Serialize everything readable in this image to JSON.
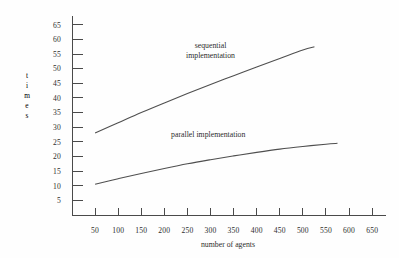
{
  "chart_data": {
    "type": "line",
    "title": "",
    "xlabel": "number of agents",
    "ylabel": "times",
    "ylabel_letters": [
      "t",
      "i",
      "m",
      "e",
      "s"
    ],
    "xlim": [
      0,
      680
    ],
    "ylim": [
      0,
      68
    ],
    "xticks": [
      50,
      100,
      150,
      200,
      250,
      300,
      350,
      400,
      450,
      500,
      550,
      600,
      650
    ],
    "xtick_labels": [
      "50",
      "100",
      "150",
      "200",
      "250",
      "300",
      "350",
      "400",
      "450",
      "500",
      "550",
      "600",
      "650"
    ],
    "yticks": [
      5,
      10,
      15,
      20,
      25,
      30,
      35,
      40,
      45,
      50,
      55,
      60,
      65
    ],
    "ytick_labels": [
      "5",
      "10",
      "15",
      "20",
      "25",
      "30",
      "35",
      "40",
      "45",
      "50",
      "55",
      "60",
      "65"
    ],
    "grid": false,
    "legend_position": "inline-annotation",
    "line_color": "#4f4f4f",
    "axis_color": "#4a4a4a",
    "background_color": "#fefefe",
    "series": [
      {
        "name": "sequential implementation",
        "annotation_lines": [
          "sequential",
          "implementation"
        ],
        "annotation_x": 300,
        "annotation_y": 57,
        "x": [
          50,
          100,
          150,
          200,
          250,
          300,
          350,
          400,
          450,
          500,
          525
        ],
        "values": [
          28.0,
          31.5,
          35.0,
          38.3,
          41.5,
          44.6,
          47.6,
          50.6,
          53.5,
          56.4,
          57.5
        ]
      },
      {
        "name": "parallel implementation",
        "annotation_lines": [
          "parallel implementation"
        ],
        "annotation_x": 295,
        "annotation_y": 26.5,
        "x": [
          50,
          100,
          150,
          200,
          250,
          300,
          350,
          400,
          450,
          500,
          550,
          575
        ],
        "values": [
          10.5,
          12.4,
          14.2,
          15.9,
          17.5,
          18.9,
          20.2,
          21.4,
          22.5,
          23.4,
          24.2,
          24.5
        ]
      }
    ]
  }
}
